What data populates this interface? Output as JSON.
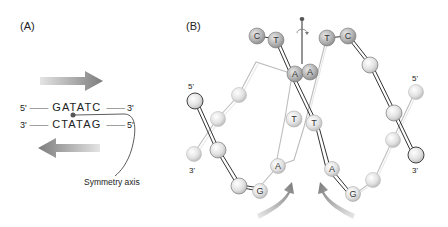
{
  "panels": {
    "a": {
      "label": "(A)",
      "top_strand": {
        "five": "5'",
        "bases": "GATATC",
        "three": "3'",
        "squiggle": "~~~~~"
      },
      "bottom_strand": {
        "three": "3'",
        "bases": "CTATAG",
        "five": "5'",
        "squiggle": "~~~~~"
      },
      "symmetry_axis_label": "Symmetry axis"
    },
    "b": {
      "label": "(B)",
      "end_labels": {
        "left_top": "5'",
        "left_bottom": "3'",
        "right_top": "5'",
        "right_bottom": "3'"
      },
      "bases": {
        "top_left_c": "C",
        "top_left_t": "T",
        "top_right_t": "T",
        "top_right_c": "C",
        "mid_a_left": "A",
        "mid_a_right": "A",
        "mid_t_left": "T",
        "mid_t_right": "T",
        "low_a_left": "A",
        "low_g_left": "G",
        "low_a_right": "A",
        "low_g_right": "G"
      }
    }
  },
  "colors": {
    "arrow_gray": "#8a8a8a",
    "node_light": "#e6e6e6",
    "node_dark": "#a9a9a9",
    "strand_dark": "#333333",
    "strand_light": "#bdbdbd",
    "axis_pin": "#d2574a"
  }
}
